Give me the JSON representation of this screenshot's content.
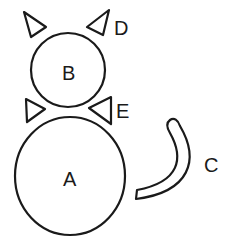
{
  "diagram": {
    "colors": {
      "stroke": "#1a1a1a",
      "background": "#ffffff"
    },
    "parts": [
      {
        "id": "A",
        "label": "A",
        "shape": "circle",
        "role": "body"
      },
      {
        "id": "B",
        "label": "B",
        "shape": "circle",
        "role": "head"
      },
      {
        "id": "C",
        "label": "C",
        "shape": "curved band",
        "role": "tail"
      },
      {
        "id": "D",
        "label": "D",
        "shape": "pair of triangles",
        "role": "ears"
      },
      {
        "id": "E",
        "label": "E",
        "shape": "pair of triangles",
        "role": "bow tie"
      }
    ],
    "labels": {
      "a": "A",
      "b": "B",
      "c": "C",
      "d": "D",
      "e": "E"
    }
  }
}
